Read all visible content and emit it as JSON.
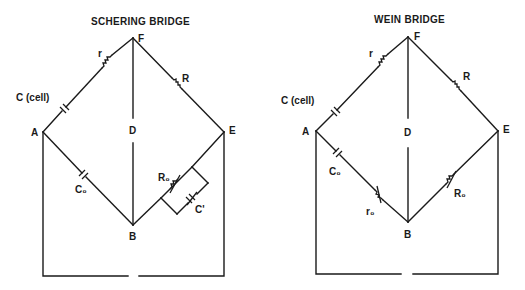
{
  "diagrams": [
    {
      "title": "SCHERING BRIDGE",
      "nodes": {
        "A": "A",
        "B": "B",
        "D": "D",
        "E": "E",
        "F": "F"
      },
      "components": {
        "c_cell": "C (cell)",
        "r": "r",
        "R": "R",
        "C0": "C₀",
        "R0": "R₀",
        "C_prime": "C'"
      }
    },
    {
      "title": "WEIN BRIDGE",
      "nodes": {
        "A": "A",
        "B": "B",
        "D": "D",
        "E": "E",
        "F": "F"
      },
      "components": {
        "c_cell": "C (cell)",
        "r": "r",
        "R": "R",
        "C0": "C₀",
        "r0": "r₀",
        "R0": "R₀"
      }
    }
  ]
}
